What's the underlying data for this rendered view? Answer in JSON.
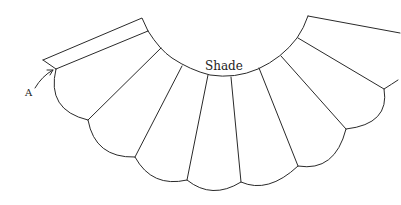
{
  "diagram": {
    "labels": {
      "center": "Shade",
      "marker": "A"
    },
    "colors": {
      "background": "#ffffff",
      "stroke": "#2a2a2a"
    },
    "panel_count": 7,
    "elements": [
      "top band",
      "inner arc",
      "radial seam lines",
      "scalloped outer edge",
      "arrow to point A"
    ]
  }
}
